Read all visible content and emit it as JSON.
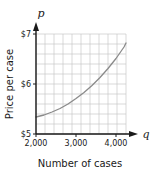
{
  "chart_data": {
    "type": "line",
    "title": "",
    "subtitle": "",
    "xlabel": "Number of cases",
    "ylabel": "Price per case",
    "x_axis_variable": "q",
    "y_axis_variable": "p",
    "xlim": [
      2000,
      4250
    ],
    "ylim": [
      5,
      7
    ],
    "grid": true,
    "grid_columns": 10,
    "grid_rows": 10,
    "x_gridline_step": 225,
    "y_gridline_step": 0.2,
    "legend": "none",
    "xticks": [
      2000,
      3000,
      4000
    ],
    "xticklabels": [
      "2,000",
      "3,000",
      "4,000"
    ],
    "yticks": [
      5,
      6,
      7
    ],
    "yticklabels": [
      "$5",
      "$6",
      "$7"
    ],
    "series": [
      {
        "name": "supply curve",
        "color": "#8a8a8a",
        "x": [
          2000,
          2200,
          2400,
          2600,
          2800,
          3000,
          3200,
          3400,
          3600,
          3800,
          4000,
          4200,
          4250
        ],
        "y": [
          5.34,
          5.38,
          5.44,
          5.51,
          5.6,
          5.71,
          5.83,
          5.97,
          6.13,
          6.31,
          6.51,
          6.74,
          6.82
        ]
      }
    ],
    "annotations": []
  },
  "labels": {
    "y_axis_variable": "p",
    "x_axis_variable": "q",
    "y_tick_top": "$7",
    "y_tick_mid": "$6",
    "y_tick_bottom": "$5",
    "x_tick_left": "2,000",
    "x_tick_mid": "3,000",
    "x_tick_right": "4,000",
    "y_axis_title": "Price per case",
    "x_axis_title": "Number of cases"
  },
  "colors": {
    "curve": "#8a8a8a",
    "grid": "#c9c9c9",
    "axis": "#1a1a1a",
    "background": "#ffffff",
    "text": "#1a1a1a"
  }
}
